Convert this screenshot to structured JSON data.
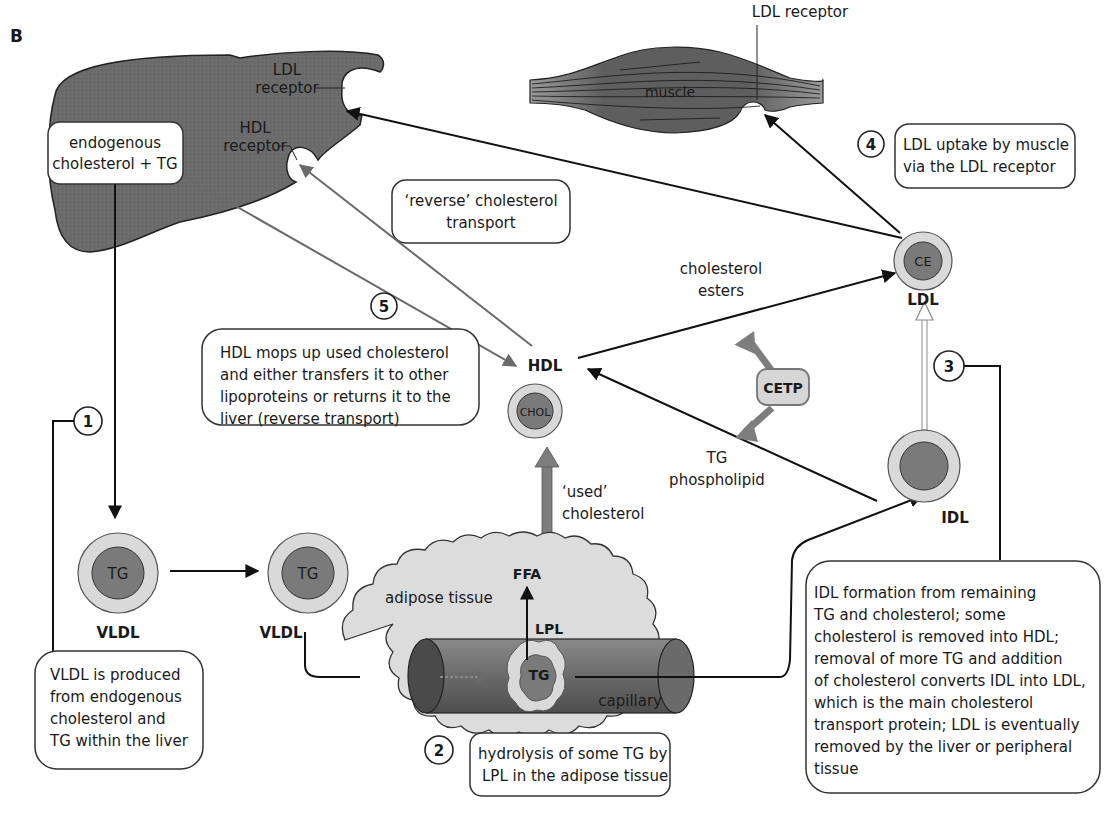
{
  "panel_label": "B",
  "colors": {
    "organ_fill": "#6b6b6b",
    "muscle_fill": "#6e6e6e",
    "lipoprotein_outer": "#d9d9d9",
    "lipoprotein_core": "#7a7a7a",
    "adipose_fill": "#dcdcdc",
    "gray_arrow": "#7d7d7d",
    "cetp_fill": "#d6d6d6"
  },
  "liver": {
    "ldl_receptor_label_1": "LDL",
    "ldl_receptor_label_2": "receptor",
    "hdl_receptor_label_1": "HDL",
    "hdl_receptor_label_2": "receptor",
    "source_box_line1": "endogenous",
    "source_box_line2": "cholesterol + TG"
  },
  "muscle": {
    "label": "muscle",
    "receptor_label": "LDL receptor"
  },
  "boxes": {
    "reverse_line1": "‘reverse’ cholesterol",
    "reverse_line2": "transport",
    "step1": [
      "VLDL is produced",
      "from endogenous",
      "cholesterol and",
      "TG within the liver"
    ],
    "step2": [
      "hydrolysis of some TG by",
      "LPL in the adipose tissue"
    ],
    "step3": [
      "IDL formation from remaining",
      "TG and cholesterol; some",
      "cholesterol is removed into HDL;",
      "removal of more TG and addition",
      "of cholesterol converts IDL into LDL,",
      "which is the main cholesterol",
      "transport protein; LDL is eventually",
      "removed by the liver or peripheral",
      "tissue"
    ],
    "step4": [
      "LDL uptake by muscle",
      "via the LDL receptor"
    ],
    "step5": [
      "HDL mops up used cholesterol",
      "and either transfers it to other",
      "lipoproteins or returns it to the",
      "liver (reverse transport)"
    ]
  },
  "steps": [
    "1",
    "2",
    "3",
    "4",
    "5"
  ],
  "particles": {
    "vldl1": {
      "core": "TG",
      "label": "VLDL"
    },
    "vldl2": {
      "core": "TG",
      "label": "VLDL"
    },
    "hdl": {
      "core": "CHOL",
      "label": "HDL"
    },
    "idl": {
      "core": "",
      "label": "IDL"
    },
    "ldl": {
      "core": "CE",
      "label": "LDL"
    }
  },
  "annotations": {
    "cholesterol_esters_1": "cholesterol",
    "cholesterol_esters_2": "esters",
    "tg_phospholipid_1": "TG",
    "tg_phospholipid_2": "phospholipid",
    "used_cholesterol_1": "‘used’",
    "used_cholesterol_2": "cholesterol",
    "cetp": "CETP",
    "adipose": "adipose tissue",
    "ffa": "FFA",
    "lpl": "LPL",
    "capillary_tg": "TG",
    "capillary": "capillary"
  }
}
